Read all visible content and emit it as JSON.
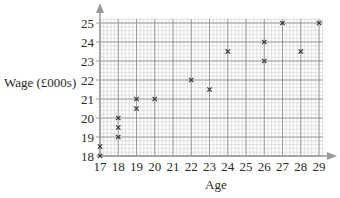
{
  "chart_data": {
    "type": "scatter",
    "title": "",
    "xlabel": "Age",
    "ylabel": "Wage (£000s)",
    "xlim": [
      17,
      29
    ],
    "ylim": [
      18,
      25
    ],
    "x_ticks": [
      17,
      18,
      19,
      20,
      21,
      22,
      23,
      24,
      25,
      26,
      27,
      28,
      29
    ],
    "y_ticks": [
      18,
      19,
      20,
      21,
      22,
      23,
      24,
      25
    ],
    "grid": true,
    "grid_minor_subdivisions": 5,
    "marker": "x",
    "legend": null,
    "points": [
      {
        "x": 17,
        "y": 18
      },
      {
        "x": 17,
        "y": 18.5
      },
      {
        "x": 18,
        "y": 19
      },
      {
        "x": 18,
        "y": 19.5
      },
      {
        "x": 18,
        "y": 20
      },
      {
        "x": 19,
        "y": 20.5
      },
      {
        "x": 19,
        "y": 21
      },
      {
        "x": 20,
        "y": 21
      },
      {
        "x": 22,
        "y": 22
      },
      {
        "x": 23,
        "y": 21.5
      },
      {
        "x": 24,
        "y": 23.5
      },
      {
        "x": 26,
        "y": 23
      },
      {
        "x": 26,
        "y": 24
      },
      {
        "x": 27,
        "y": 25
      },
      {
        "x": 28,
        "y": 23.5
      },
      {
        "x": 29,
        "y": 25
      }
    ]
  },
  "colors": {
    "major_grid": "#8a8a8a",
    "minor_grid": "#cfcfcf",
    "axis": "#9a9a9a",
    "marker": "#333333",
    "text": "#2a2a2a"
  }
}
